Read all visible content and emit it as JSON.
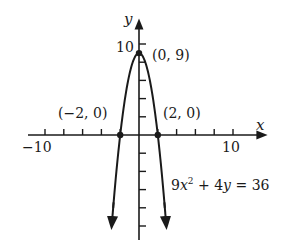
{
  "chart_data": {
    "type": "line",
    "title": "",
    "xlabel": "x",
    "ylabel": "y",
    "equation": "9x^2 + 4y = 36",
    "function": "y = 9 - (9/4)x^2",
    "xlim": [
      -10,
      10
    ],
    "ylim": [
      -11,
      11
    ],
    "x_tick_step": 2,
    "y_tick_step": 2,
    "x_tick_labels": [
      "-10",
      "10"
    ],
    "y_tick_labels": [
      "10"
    ],
    "grid": false,
    "labeled_points": [
      {
        "label": "(0, 9)",
        "x": 0,
        "y": 9
      },
      {
        "label": "(-2, 0)",
        "x": -2,
        "y": 0
      },
      {
        "label": "(2, 0)",
        "x": 2,
        "y": 0
      }
    ],
    "series": [
      {
        "name": "9x^2 + 4y = 36",
        "x": [
          -2.9,
          -2,
          -1,
          0,
          1,
          2,
          2.9
        ],
        "y": [
          -9.9,
          0,
          6.75,
          9,
          6.75,
          0,
          -9.9
        ]
      }
    ]
  },
  "labels": {
    "x_axis": "x",
    "y_axis": "y",
    "x_min": "−10",
    "x_max": "10",
    "y_max": "10",
    "vertex": "(0, 9)",
    "left_intercept": "(−2, 0)",
    "right_intercept": "(2, 0)",
    "equation_a": "9",
    "equation_b": "x",
    "equation_c": "2",
    "equation_d": " + 4",
    "equation_e": "y",
    "equation_f": " = 36"
  }
}
